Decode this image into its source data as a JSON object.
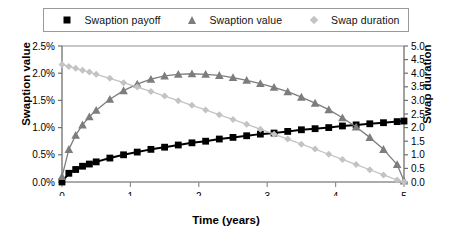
{
  "chart_data": {
    "type": "line",
    "title": "",
    "xlabel": "Time (years)",
    "ylabel": "Swaption value",
    "ylabel_secondary": "Swap duration",
    "xlim": [
      0,
      5
    ],
    "ylim": [
      0,
      0.025
    ],
    "ylim_secondary": [
      0,
      5
    ],
    "grid": false,
    "legend_position": "top",
    "x_ticks": [
      "0",
      "1",
      "2",
      "3",
      "4",
      "5"
    ],
    "x_tick_values": [
      0,
      1,
      2,
      3,
      4,
      5
    ],
    "y_ticks": [
      "0.0%",
      "0.5%",
      "1.0%",
      "1.5%",
      "2.0%",
      "2.5%"
    ],
    "y_tick_values": [
      0.0,
      0.005,
      0.01,
      0.015,
      0.02,
      0.025
    ],
    "y_ticks_secondary": [
      "0.0",
      "0.5",
      "1.0",
      "1.5",
      "2.0",
      "2.5",
      "3.0",
      "3.5",
      "4.0",
      "4.5",
      "5.0"
    ],
    "y_tick_values_secondary": [
      0.0,
      0.5,
      1.0,
      1.5,
      2.0,
      2.5,
      3.0,
      3.5,
      4.0,
      4.5,
      5.0
    ],
    "x": [
      0.0,
      0.1,
      0.2,
      0.3,
      0.4,
      0.5,
      0.7,
      0.9,
      1.1,
      1.3,
      1.5,
      1.7,
      1.9,
      2.1,
      2.3,
      2.5,
      2.7,
      2.9,
      3.1,
      3.3,
      3.5,
      3.7,
      3.9,
      4.1,
      4.3,
      4.5,
      4.7,
      4.9,
      5.0
    ],
    "series": [
      {
        "name": "Swaption payoff",
        "axis": "left",
        "color": "#000000",
        "marker": "square",
        "units": "percent",
        "values": [
          0.0,
          0.16,
          0.23,
          0.29,
          0.33,
          0.37,
          0.44,
          0.5,
          0.55,
          0.6,
          0.64,
          0.68,
          0.72,
          0.75,
          0.79,
          0.82,
          0.85,
          0.88,
          0.9,
          0.93,
          0.96,
          0.98,
          1.0,
          1.03,
          1.05,
          1.07,
          1.09,
          1.11,
          1.12
        ]
      },
      {
        "name": "Swaption value",
        "axis": "left",
        "color": "#7d7d7d",
        "marker": "triangle",
        "units": "percent",
        "values": [
          0.1,
          0.6,
          0.86,
          1.05,
          1.2,
          1.32,
          1.52,
          1.68,
          1.8,
          1.89,
          1.95,
          1.98,
          1.99,
          1.98,
          1.96,
          1.92,
          1.87,
          1.81,
          1.74,
          1.66,
          1.56,
          1.45,
          1.33,
          1.18,
          1.01,
          0.82,
          0.6,
          0.32,
          0.02
        ]
      },
      {
        "name": "Swap duration",
        "axis": "right",
        "color": "#c3c3c3",
        "marker": "diamond",
        "units": "years",
        "values": [
          4.32,
          4.25,
          4.18,
          4.11,
          4.04,
          3.96,
          3.81,
          3.65,
          3.49,
          3.33,
          3.16,
          2.99,
          2.82,
          2.65,
          2.47,
          2.3,
          2.12,
          1.94,
          1.76,
          1.58,
          1.39,
          1.21,
          1.02,
          0.83,
          0.64,
          0.45,
          0.26,
          0.07,
          0.0
        ]
      }
    ]
  },
  "legend": {
    "entries": [
      {
        "label": "Swaption payoff",
        "marker": "square",
        "color": "#000000"
      },
      {
        "label": "Swaption value",
        "marker": "triangle",
        "color": "#7d7d7d"
      },
      {
        "label": "Swap  duration",
        "marker": "diamond",
        "color": "#c3c3c3"
      }
    ]
  },
  "axes": {
    "x_title": "Time (years)",
    "y_left_title": "Swaption value",
    "y_right_title": "Swap duration"
  }
}
